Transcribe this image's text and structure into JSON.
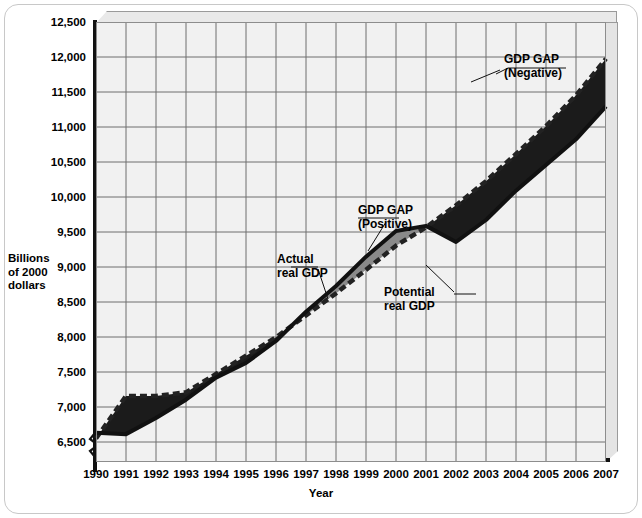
{
  "chart_data": {
    "type": "area",
    "title": "",
    "xlabel": "Year",
    "ylabel": "Billions of 2000 dollars",
    "ylabel_lines": [
      "Billions",
      "of 2000",
      "dollars"
    ],
    "x": [
      1990,
      1991,
      1992,
      1993,
      1994,
      1995,
      1996,
      1997,
      1998,
      1999,
      2000,
      2001,
      2002,
      2003,
      2004,
      2005,
      2006,
      2007
    ],
    "categories": [
      "1990",
      "1991",
      "1992",
      "1993",
      "1994",
      "1995",
      "1996",
      "1997",
      "1998",
      "1999",
      "2000",
      "2001",
      "2002",
      "2003",
      "2004",
      "2005",
      "2006",
      "2007"
    ],
    "xlim": [
      1990,
      2007
    ],
    "ylim": [
      6500,
      12500
    ],
    "ytick_values": [
      6500,
      7000,
      7500,
      8000,
      8500,
      9000,
      9500,
      10000,
      10500,
      11000,
      11500,
      12000,
      12500
    ],
    "ytick_labels": [
      "6,500",
      "7,000",
      "7,500",
      "8,000",
      "8,500",
      "9,000",
      "9,500",
      "10,000",
      "10,500",
      "11,000",
      "11,500",
      "12,000",
      "12,500"
    ],
    "y_axis_break": true,
    "grid": true,
    "legend": "none",
    "series": [
      {
        "name": "Actual real GDP",
        "style": "solid-dark",
        "values": [
          6900,
          6880,
          7100,
          7350,
          7650,
          7850,
          8150,
          8550,
          8900,
          9300,
          9650,
          9720,
          9500,
          9800,
          10200,
          10550,
          10900,
          11350
        ]
      },
      {
        "name": "Potential real GDP",
        "style": "dashed",
        "values": [
          6820,
          7400,
          7400,
          7450,
          7700,
          7950,
          8200,
          8500,
          8800,
          9120,
          9450,
          9700,
          10000,
          10330,
          10700,
          11080,
          11500,
          12000
        ]
      }
    ],
    "bands": [
      {
        "name": "GDP GAP (Negative)",
        "meaning": "potential above actual",
        "fill": "#1b1b1b",
        "periods": [
          "1990-1997",
          "2001-2007"
        ]
      },
      {
        "name": "GDP GAP (Positive)",
        "meaning": "actual above potential",
        "fill": "#8a8a8a",
        "periods": [
          "1997-2001"
        ]
      }
    ],
    "annotations": [
      {
        "id": "gap-negative",
        "text": "GDP GAP\n(Negative)",
        "x": 2004,
        "y": 11950
      },
      {
        "id": "gap-positive",
        "text": "GDP GAP\n(Positive)",
        "x": 2000,
        "y": 9900
      },
      {
        "id": "actual-real-gdp",
        "text": "Actual\nreal GDP",
        "x": 1996,
        "y": 8950
      },
      {
        "id": "potential-real-gdp",
        "text": "Potential\nreal GDP",
        "x": 2001,
        "y": 8600
      }
    ]
  },
  "colors": {
    "plot_background": "#f1f1f1",
    "grid_line": "#6f6f6f",
    "axis": "#111111",
    "band_negative": "#1b1b1b",
    "band_positive": "#8a8a8a",
    "actual_line": "#111111",
    "potential_line": "#222222",
    "frame": "#c8c8c8"
  }
}
